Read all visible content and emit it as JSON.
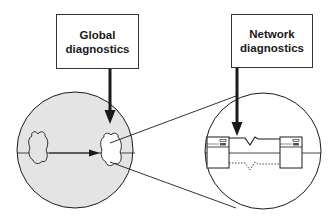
{
  "diagram": {
    "boxes": [
      {
        "id": "global",
        "line1": "Global",
        "line2": "diagnostics"
      },
      {
        "id": "network",
        "line1": "Network",
        "line2": "diagnostics"
      }
    ],
    "colors": {
      "stroke": "#1a1a1a",
      "left_circle_fill": "#e4e4e4",
      "right_circle_fill": "#ffffff",
      "highlight_cloud_fill": "#ffffff",
      "server_fill": "#ffffff"
    },
    "elements": {
      "left_circle": "network overview (gray)",
      "right_circle": "zoomed-in network link",
      "clouds": [
        "source network cloud",
        "highlighted destination cloud"
      ],
      "servers": [
        "left server",
        "right server"
      ],
      "links": [
        "solid zig-zag link",
        "dashed zig-zag link"
      ]
    }
  }
}
